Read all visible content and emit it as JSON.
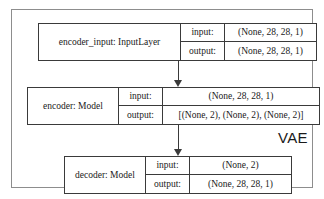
{
  "diagram": {
    "container_label": "VAE",
    "io_keys": {
      "input": "input:",
      "output": "output:"
    },
    "nodes": [
      {
        "id": "encoder_input",
        "name": "encoder_input: InputLayer",
        "input": "(None, 28, 28, 1)",
        "output": "(None, 28, 28, 1)"
      },
      {
        "id": "encoder",
        "name": "encoder: Model",
        "input": "(None, 28, 28, 1)",
        "output": "[(None, 2), (None, 2), (None, 2)]"
      },
      {
        "id": "decoder",
        "name": "decoder: Model",
        "input": "(None, 2)",
        "output": "(None, 28, 28, 1)"
      }
    ],
    "edges": [
      {
        "id": "input-to-encoder",
        "from": "encoder_input",
        "to": "encoder"
      },
      {
        "id": "encoder-to-decoder",
        "from": "encoder",
        "to": "decoder"
      }
    ],
    "colors": {
      "box_border": "#3a3a3a",
      "container_border": "#8d8d8d",
      "background": "#ffffff",
      "text": "#1a1a1a"
    }
  }
}
